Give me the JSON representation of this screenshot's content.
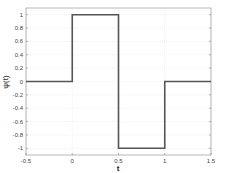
{
  "chart_data": {
    "type": "line",
    "title": "",
    "xlabel": "t",
    "ylabel": "ψ(t)",
    "xlim": [
      -0.5,
      1.5
    ],
    "ylim": [
      -1.1,
      1.1
    ],
    "grid": true,
    "xticks": [
      -0.5,
      0,
      0.5,
      1,
      1.5
    ],
    "xtick_labels": [
      "-0.5",
      "0",
      "0.5",
      "1",
      "1.5"
    ],
    "yticks": [
      1,
      0.8,
      0.6,
      0.4,
      0.2,
      0,
      -0.2,
      -0.4,
      -0.6,
      -0.8,
      -1
    ],
    "ytick_labels": [
      "1",
      "0.8",
      "0.6",
      "0.4",
      "0.2",
      "0",
      "-0.2",
      "-0.4",
      "-0.6",
      "-0.8",
      "-1"
    ],
    "series": [
      {
        "name": "psi",
        "color": "#555555",
        "x": [
          -0.5,
          0,
          0,
          0.5,
          0.5,
          1,
          1,
          1.5
        ],
        "y": [
          0,
          0,
          1,
          1,
          -1,
          -1,
          0,
          0
        ]
      }
    ]
  }
}
